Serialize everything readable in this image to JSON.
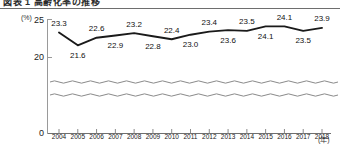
{
  "title": {
    "text": "図表 1  高齢化率の推移",
    "cropped": true
  },
  "axes": {
    "y_unit": "(%)",
    "x_unit": "(年)",
    "y_ticks": [
      "25",
      "20",
      "0"
    ],
    "break_marker": "wavy-axis-break"
  },
  "chart_data": {
    "type": "line",
    "title": "図表 1  高齢化率の推移",
    "xlabel": "(年)",
    "ylabel": "(%)",
    "categories": [
      "2004",
      "2005",
      "2006",
      "2007",
      "2008",
      "2009",
      "2010",
      "2011",
      "2012",
      "2013",
      "2014",
      "2015",
      "2016",
      "2017",
      "2018"
    ],
    "values": [
      23.3,
      21.6,
      22.6,
      22.9,
      23.2,
      22.8,
      22.4,
      23.0,
      23.4,
      23.6,
      23.5,
      24.1,
      24.1,
      23.5,
      23.9
    ],
    "value_labels": [
      "23.3",
      "21.6",
      "22.6",
      "22.9",
      "23.2",
      "22.8",
      "22.4",
      "23.0",
      "23.4",
      "23.6",
      "23.5",
      "24.1",
      "24.1",
      "23.5",
      "23.9"
    ],
    "label_positions": [
      "above",
      "below",
      "above",
      "below",
      "above",
      "below",
      "above",
      "below",
      "above",
      "below",
      "above",
      "below",
      "above",
      "below",
      "above"
    ],
    "ylim": [
      20,
      25
    ],
    "y_axis_broken": true,
    "y_break_between": [
      0,
      20
    ],
    "grid": false,
    "legend": null,
    "line_color": "#1a1a1a",
    "marker": "none"
  }
}
